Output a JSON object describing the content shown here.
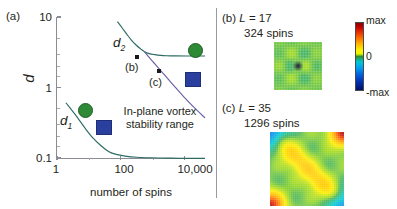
{
  "panel_a": {
    "tag": "(a)",
    "ylabel": "d",
    "xlabel": "number of spins",
    "ytick_labels": [
      "10",
      "1",
      "0.1"
    ],
    "xtick_labels": [
      "1",
      "100",
      "10,000"
    ],
    "curve_labels": {
      "d1": "d",
      "d1_sub": "1",
      "d2": "d",
      "d2_sub": "2"
    },
    "point_labels": {
      "b": "(b)",
      "c": "(c)"
    },
    "region_text_line1": "In-plane vortex",
    "region_text_line2": "stability range",
    "colors": {
      "axis": "#8c8c94",
      "curve_teal": "#2d6b63",
      "curve_purple": "#6b5fa8",
      "marker_circle": "#2f8a36",
      "marker_square": "#2b3f9e",
      "marker_small": "#1a1a1a"
    }
  },
  "panel_b": {
    "tag": "(b)",
    "L_label": "L",
    "L_equals": "= 17",
    "spins": "324 spins"
  },
  "panel_c": {
    "tag": "(c)",
    "L_label": "L",
    "L_equals": "= 35",
    "spins": "1296 spins"
  },
  "colorbar": {
    "top_label": "max",
    "mid_label": "0",
    "bottom_label": "-max"
  },
  "chart_data": {
    "type": "line",
    "title": "",
    "xlabel": "number of spins",
    "ylabel": "d",
    "xscale": "log",
    "yscale": "log",
    "xlim": [
      1,
      100000
    ],
    "ylim": [
      0.1,
      10
    ],
    "grid": false,
    "legend": "inline-curve-labels",
    "xtick_values": [
      1,
      100,
      10000
    ],
    "xtick_labels": [
      "1",
      "100",
      "10,000"
    ],
    "ytick_values": [
      0.1,
      1,
      10
    ],
    "ytick_labels": [
      "0.1",
      "1",
      "10"
    ],
    "series": [
      {
        "name": "d1",
        "label": "d₁",
        "color": "#2d6b63",
        "comment": "lower boundary of in-plane vortex stability range",
        "x": [
          2,
          3,
          5,
          9,
          16,
          30,
          55,
          100,
          200,
          500,
          1500,
          5000,
          20000,
          100000
        ],
        "y": [
          0.62,
          0.5,
          0.38,
          0.27,
          0.2,
          0.155,
          0.128,
          0.116,
          0.11,
          0.106,
          0.104,
          0.103,
          0.102,
          0.102
        ]
      },
      {
        "name": "d2",
        "label": "d₂",
        "color": "#2d6b63",
        "comment": "upper boundary; at ~800 spins it bifurcates into a flat teal branch and a descending purple branch",
        "x": [
          110,
          160,
          230,
          330,
          480,
          700,
          900,
          1300,
          2000,
          3200,
          5000,
          10000,
          30000,
          100000
        ],
        "y": [
          8.6,
          7.0,
          5.7,
          4.7,
          4.0,
          3.5,
          3.25,
          3.05,
          2.95,
          2.88,
          2.85,
          2.83,
          2.82,
          2.82
        ]
      },
      {
        "name": "d2_purple_branch",
        "label": "",
        "color": "#6b5fa8",
        "comment": "descending branch after bifurcation, passes through point (c)",
        "x": [
          900,
          1300,
          1900,
          2700,
          4000,
          6000,
          10000,
          20000,
          50000,
          100000
        ],
        "y": [
          3.25,
          2.7,
          2.25,
          1.9,
          1.58,
          1.3,
          1.02,
          0.74,
          0.5,
          0.38
        ]
      }
    ],
    "annotations": [
      {
        "name": "point-b",
        "label": "(b)",
        "marker": "square",
        "color": "#1a1a1a",
        "x": 324,
        "y": 3.55,
        "comment": "L = 17, 324 spins"
      },
      {
        "name": "point-c",
        "label": "(c)",
        "marker": "square",
        "color": "#1a1a1a",
        "x": 1296,
        "y": 2.55,
        "comment": "L = 35, 1296 spins"
      },
      {
        "name": "marker-circle-small",
        "marker": "circle",
        "color": "#2f8a36",
        "x": 14,
        "y": 0.39
      },
      {
        "name": "marker-square-small",
        "marker": "square",
        "color": "#2b3f9e",
        "x": 45,
        "y": 0.21
      },
      {
        "name": "marker-circle-large",
        "marker": "circle",
        "color": "#2f8a36",
        "x": 14000,
        "y": 4.6
      },
      {
        "name": "marker-square-large",
        "marker": "square",
        "color": "#2b3f9e",
        "x": 13000,
        "y": 2.05
      }
    ],
    "region_annotation": {
      "text": "In-plane vortex stability range",
      "x": 1200,
      "y": 0.55
    }
  },
  "heatmap_data": {
    "type": "heatmap",
    "colormap": "jet",
    "colorbar_labels": [
      "max",
      "0",
      "-max"
    ],
    "panels": [
      {
        "name": "panel-b-heatmap",
        "L": 17,
        "n_spins": 324,
        "grid": [
          18,
          18
        ],
        "pattern": "in-plane vortex: green background with a central four-lobed quadrupole — warm (yellow/orange/red) lobe left of centre, cool (cyan/blue) lobe right of centre, dark core"
      },
      {
        "name": "panel-c-heatmap",
        "L": 35,
        "n_spins": 1296,
        "grid": [
          36,
          36
        ],
        "pattern": "large-L state: red/orange hot corners at bottom-left and top-right, blue cold corners at top-left and bottom-right, yellow-green diagonal band from bottom-left to top-right"
      }
    ]
  }
}
